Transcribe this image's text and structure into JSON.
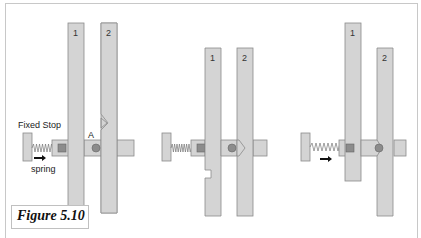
{
  "figure": {
    "caption": "Figure 5.10",
    "colors": {
      "bar_fill": "#d4d4d4",
      "bar_stroke": "#8a8a8a",
      "square_fill": "#8c8c8c",
      "pin_fill": "#8c8c8c",
      "spring": "#777777",
      "arrow": "#111111",
      "frame": "#c8c8c8"
    },
    "panels": [
      {
        "id": "panel-1",
        "labels": {
          "fixed_stop": "Fixed Stop",
          "spring": "spring",
          "point_a": "A",
          "bar1": "1",
          "bar2": "2"
        }
      },
      {
        "id": "panel-2",
        "labels": {
          "bar1": "1",
          "bar2": "2"
        }
      },
      {
        "id": "panel-3",
        "labels": {
          "bar1": "1",
          "bar2": "2"
        }
      }
    ]
  }
}
